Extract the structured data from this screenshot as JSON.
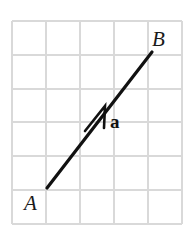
{
  "figure": {
    "background_color": "#ffffff",
    "width": 189,
    "height": 231
  },
  "grid": {
    "line_color": "#d9d9d9",
    "line_width": 1.4,
    "columns": 5,
    "rows": 6,
    "cell_size": 34,
    "origin_x": 12,
    "origin_y": 21,
    "right_x": 182,
    "bottom_y": 224,
    "x_positions": [
      12,
      46,
      80,
      114,
      148,
      182
    ],
    "y_positions": [
      21,
      55,
      89,
      122,
      156,
      190,
      224
    ]
  },
  "vector": {
    "name": "a",
    "label": "a",
    "label_x": 110,
    "label_y": 128,
    "color": "#111111",
    "shaft_width": 3.2,
    "start_x": 47,
    "start_y": 188,
    "end_x": 152,
    "end_y": 52,
    "arrowhead": {
      "tip_x": 105,
      "tip_y": 106,
      "left_barb_x": 85,
      "left_barb_y": 131,
      "right_barb_x": 104,
      "right_barb_y": 128,
      "stroke_width": 2.6
    }
  },
  "points": [
    {
      "id": "point-a",
      "label": "A",
      "label_x": 24,
      "label_y": 210,
      "marker_x": 47,
      "marker_y": 188
    },
    {
      "id": "point-b",
      "label": "B",
      "label_x": 152,
      "label_y": 46,
      "marker_x": 152,
      "marker_y": 52
    }
  ]
}
